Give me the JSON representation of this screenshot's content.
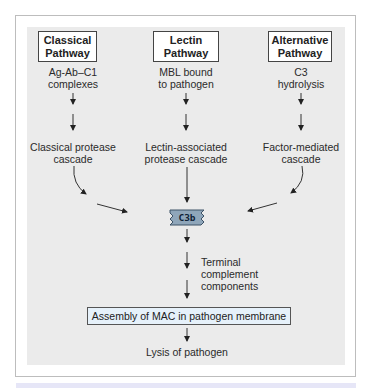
{
  "diagram": {
    "pathways": [
      {
        "title_line1": "Classical",
        "title_line2": "Pathway",
        "trigger_line1": "Ag-Ab–C1",
        "trigger_line2": "complexes",
        "cascade_line1": "Classical protease",
        "cascade_line2": "cascade"
      },
      {
        "title_line1": "Lectin",
        "title_line2": "Pathway",
        "trigger_line1": "MBL bound",
        "trigger_line2": "to pathogen",
        "cascade_line1": "Lectin-associated",
        "cascade_line2": "protease cascade"
      },
      {
        "title_line1": "Alternative",
        "title_line2": "Pathway",
        "trigger_line1": "C3",
        "trigger_line2": "hydrolysis",
        "cascade_line1": "Factor-mediated",
        "cascade_line2": "cascade"
      }
    ],
    "convergence_node": "C3b",
    "terminal_label_line1": "Terminal",
    "terminal_label_line2": "complement",
    "terminal_label_line3": "components",
    "mac_box": "Assembly of MAC in pathogen membrane",
    "outcome": "Lysis of pathogen",
    "colors": {
      "panel_bg": "#ebebeb",
      "c3b_fill": "#8fa6ba",
      "mac_fill": "#e6f1fa",
      "strip": "#e6e6f7"
    }
  }
}
